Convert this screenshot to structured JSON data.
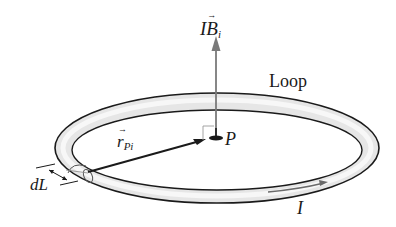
{
  "diagram": {
    "title": "",
    "labels": {
      "field": {
        "main": "B",
        "prefix": "I",
        "sub": "i",
        "vector": true
      },
      "loop": "Loop",
      "radius": {
        "main": "r",
        "sub": "Pi",
        "vector": true
      },
      "point": "P",
      "element": "dL",
      "current": "I"
    },
    "colors": {
      "background": "#ffffff",
      "outline": "#1a1a1a",
      "tube_fill": "#e4e4e4",
      "tube_highlight": "#f6f6f6",
      "field_arrow": "#7a7a7a",
      "radius_arrow": "#1a1a1a",
      "current_arrow": "#6a6a6a"
    }
  }
}
